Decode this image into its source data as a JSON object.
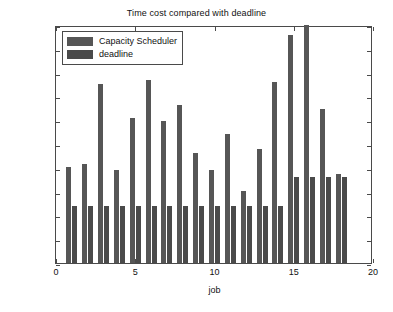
{
  "chart_data": {
    "type": "bar",
    "title": "Time cost compared with deadline",
    "xlabel": "job",
    "ylabel": "time/s",
    "grid": false,
    "legend_position": "upper-left",
    "xlim": [
      0,
      20
    ],
    "ylim": [
      0,
      500
    ],
    "xticks": [
      0,
      5,
      10,
      15,
      20
    ],
    "yticks": [
      0,
      50,
      100,
      150,
      200,
      250,
      300,
      350,
      400,
      450,
      500
    ],
    "categories": [
      1,
      2,
      3,
      4,
      5,
      6,
      7,
      8,
      9,
      10,
      11,
      12,
      13,
      14,
      15,
      16,
      17,
      18
    ],
    "series": [
      {
        "name": "Capacity Scheduler",
        "color": "#565656",
        "values": [
          202,
          207,
          377,
          195,
          305,
          385,
          298,
          332,
          231,
          196,
          270,
          152,
          240,
          381,
          478,
          510,
          323,
          188
        ]
      },
      {
        "name": "deadline",
        "color": "#4a4a4a",
        "values": [
          120,
          120,
          120,
          120,
          120,
          120,
          120,
          120,
          120,
          120,
          120,
          120,
          120,
          120,
          180,
          180,
          180,
          180
        ]
      }
    ]
  },
  "legend": {
    "entries": [
      {
        "label": "Capacity Scheduler"
      },
      {
        "label": "deadline"
      }
    ]
  },
  "axis_tick_labels": {
    "y": [
      "0",
      "50",
      "100",
      "150",
      "200",
      "250",
      "300",
      "350",
      "400",
      "450",
      "500"
    ],
    "x": [
      "0",
      "5",
      "10",
      "15",
      "20"
    ]
  }
}
